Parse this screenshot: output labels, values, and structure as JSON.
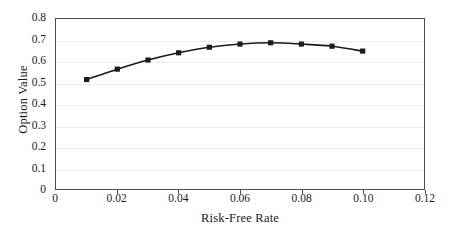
{
  "chart_data": {
    "type": "line",
    "title": "",
    "subtitle": "",
    "xlabel": "Risk-Free Rate",
    "ylabel": "Option Value",
    "xlim": [
      0,
      0.12
    ],
    "ylim": [
      0,
      0.8
    ],
    "xticks": [
      0,
      0.02,
      0.04,
      0.06,
      0.08,
      0.1,
      0.12
    ],
    "xtick_labels": [
      "0",
      "0.02",
      "0.04",
      "0.06",
      "0.08",
      "0.10",
      "0.12"
    ],
    "yticks": [
      0,
      0.1,
      0.2,
      0.3,
      0.4,
      0.5,
      0.6,
      0.7,
      0.8
    ],
    "ytick_labels": [
      "0",
      "0.1",
      "0.2",
      "0.3",
      "0.4",
      "0.5",
      "0.6",
      "0.7",
      "0.8"
    ],
    "grid": "horizontal",
    "legend": "none",
    "marker": "square",
    "line_color": "#1a1a1a",
    "marker_color": "#1a1a1a",
    "grid_color": "#ededed",
    "axis_color": "#4d4d4d",
    "x": [
      0.01,
      0.02,
      0.03,
      0.04,
      0.05,
      0.06,
      0.07,
      0.08,
      0.09,
      0.1
    ],
    "values": [
      0.515,
      0.564,
      0.607,
      0.641,
      0.667,
      0.682,
      0.688,
      0.682,
      0.672,
      0.649
    ],
    "series": [
      {
        "name": "Option Value",
        "x": [
          0.01,
          0.02,
          0.03,
          0.04,
          0.05,
          0.06,
          0.07,
          0.08,
          0.09,
          0.1
        ],
        "values": [
          0.515,
          0.564,
          0.607,
          0.641,
          0.667,
          0.682,
          0.688,
          0.682,
          0.672,
          0.649
        ]
      }
    ]
  }
}
